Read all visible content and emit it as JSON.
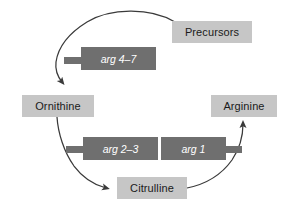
{
  "diagram": {
    "colors": {
      "metabolite_box": "#c6c6c6",
      "gene_box": "#6f6f6f",
      "arc_stroke": "#3a3a3a",
      "background": "#ffffff",
      "metabolite_text": "#1a1a1a",
      "gene_text": "#ffffff"
    },
    "metabolites": [
      {
        "id": "precursors",
        "label": "Precursors"
      },
      {
        "id": "ornithine",
        "label": "Ornithine"
      },
      {
        "id": "arginine",
        "label": "Arginine"
      },
      {
        "id": "citrulline",
        "label": "Citrulline"
      }
    ],
    "genes": [
      {
        "id": "arg-4-7",
        "label": "arg 4–7",
        "tab_side": "left"
      },
      {
        "id": "arg-2-3",
        "label": "arg 2–3",
        "tab_side": "left"
      },
      {
        "id": "arg-1",
        "label": "arg 1",
        "tab_side": "right"
      }
    ],
    "arrows": [
      {
        "id": "precursors-to-ornithine",
        "from": "Precursors",
        "to": "Ornithine",
        "via": "arg 4–7"
      },
      {
        "id": "ornithine-to-citrulline",
        "from": "Ornithine",
        "to": "Citrulline",
        "via": "arg 2–3"
      },
      {
        "id": "citrulline-to-arginine",
        "from": "Citrulline",
        "to": "Arginine",
        "via": "arg 1"
      }
    ]
  }
}
